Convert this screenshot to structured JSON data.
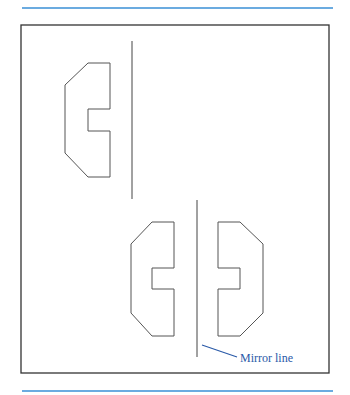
{
  "figure": {
    "label": "Mirror line",
    "colors": {
      "rule": "#3a8fd6",
      "frame": "#333333",
      "shape": "#555555",
      "label": "#2a5aa8",
      "leader": "#2a5aa8"
    },
    "shapes": [
      {
        "name": "original-shape",
        "points": "88,63 110,63 110,109 88,109 88,131 110,131 110,177 88,177 65,153 65,85"
      },
      {
        "name": "copy-shape-left",
        "points": "152,222 174,222 174,268 152,268 152,289 174,289 174,336 152,336 131,313 131,244"
      },
      {
        "name": "reflected-shape-right",
        "points": "218,222 240,222 263,244 263,313 240,336 218,336 218,289 240,289 240,268 218,268"
      }
    ]
  }
}
